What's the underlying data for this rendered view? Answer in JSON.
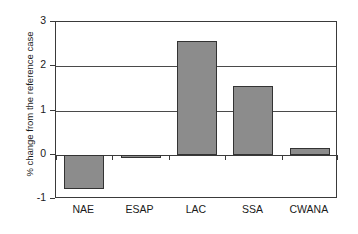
{
  "chart_data": {
    "type": "bar",
    "title": "",
    "subtitle": "",
    "xlabel": "",
    "ylabel": "% change from the reference case",
    "categories": [
      "NAE",
      "ESAP",
      "LAC",
      "SSA",
      "CWANA"
    ],
    "values": [
      -0.77,
      -0.08,
      2.58,
      1.55,
      0.15
    ],
    "series": [
      {
        "name": "% change from the reference case",
        "values": [
          -0.77,
          -0.08,
          2.58,
          1.55,
          0.15
        ]
      }
    ],
    "ylim": [
      -1,
      3
    ],
    "yticks": [
      -1,
      0,
      1,
      2,
      3
    ],
    "ytick_labels": [
      "-1",
      "0",
      "1",
      "2",
      "3"
    ],
    "gridlines": [
      1,
      2
    ],
    "zero_line": 0,
    "grid": true,
    "legend": "none",
    "legend_position": "none",
    "bar_color": "#8c8c8c",
    "bar_edge_color": "#333333",
    "axis_color": "#3a3a3a",
    "background": "#ffffff",
    "annotations": []
  },
  "axes": {
    "y": {
      "label": "% change from the reference case",
      "ticks": [
        {
          "value": 3,
          "label": "3"
        },
        {
          "value": 2,
          "label": "2"
        },
        {
          "value": 1,
          "label": "1"
        },
        {
          "value": 0,
          "label": "0"
        },
        {
          "value": -1,
          "label": "-1"
        }
      ]
    },
    "x": {
      "label": "",
      "ticks": [
        {
          "label": "NAE"
        },
        {
          "label": "ESAP"
        },
        {
          "label": "LAC"
        },
        {
          "label": "SSA"
        },
        {
          "label": "CWANA"
        }
      ]
    }
  }
}
